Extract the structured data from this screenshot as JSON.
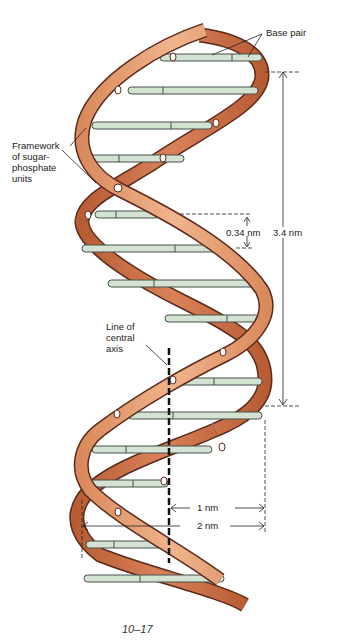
{
  "figure": {
    "caption": "10–17",
    "labels": {
      "base_pair": "Base pair",
      "framework_line1": "Framework",
      "framework_line2": "of sugar-",
      "framework_line3": "phosphate",
      "framework_line4": "units",
      "axis_line1": "Line of",
      "axis_line2": "central",
      "axis_line3": "axis"
    },
    "measurements": {
      "rise_per_base": "0.34 nm",
      "pitch": "3.4 nm",
      "radius": "1 nm",
      "diameter": "2 nm"
    },
    "colors": {
      "strand": "#e8a27a",
      "strand_dark": "#c06a44",
      "strand_edge": "#5a2a1a",
      "base_pair": "#d4e2d4",
      "base_pair_edge": "#445044",
      "annotation": "#222222"
    }
  }
}
